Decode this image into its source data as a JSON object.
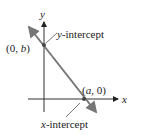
{
  "diagram": {
    "axes": {
      "x_label": "x",
      "y_label": "y"
    },
    "points": {
      "y_intercept": {
        "label_open": "(0, ",
        "var": "b",
        "label_close": ")"
      },
      "x_intercept": {
        "label_open": "(",
        "var": "a",
        "label_close": ", 0)"
      }
    },
    "callouts": {
      "y_intercept": {
        "var": "y",
        "suffix": "-intercept"
      },
      "x_intercept": {
        "var": "x",
        "suffix": "-intercept"
      }
    },
    "colors": {
      "axis": "#333333",
      "line": "#777777",
      "point": "#444444",
      "callout": "#555555"
    }
  }
}
